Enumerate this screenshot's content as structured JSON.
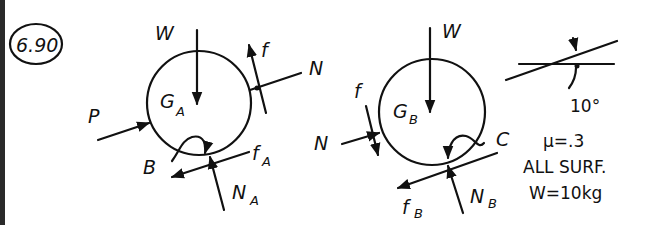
{
  "problem": {
    "number": "6.90"
  },
  "body_a": {
    "center_label": "G",
    "center_sub": "A",
    "forces": {
      "weight": "W",
      "push": "P",
      "friction_contact": "f",
      "normal_contact": "N",
      "friction_ground": "f",
      "friction_ground_sub": "A",
      "normal_ground": "N",
      "normal_ground_sub": "A"
    },
    "moment_point": "B"
  },
  "body_b": {
    "center_label": "G",
    "center_sub": "B",
    "forces": {
      "weight": "W",
      "friction_contact": "f",
      "normal_contact": "N",
      "friction_ground": "f",
      "friction_ground_sub": "B",
      "normal_ground": "N",
      "normal_ground_sub": "B"
    },
    "moment_point": "C"
  },
  "notes": {
    "angle": "10°",
    "friction_coeff": "μ=.3",
    "scope": "ALL SURF.",
    "weight": "W=10kg"
  },
  "colors": {
    "ink": "#111111",
    "paper": "#ffffff",
    "edge": "#2a2a2a"
  }
}
